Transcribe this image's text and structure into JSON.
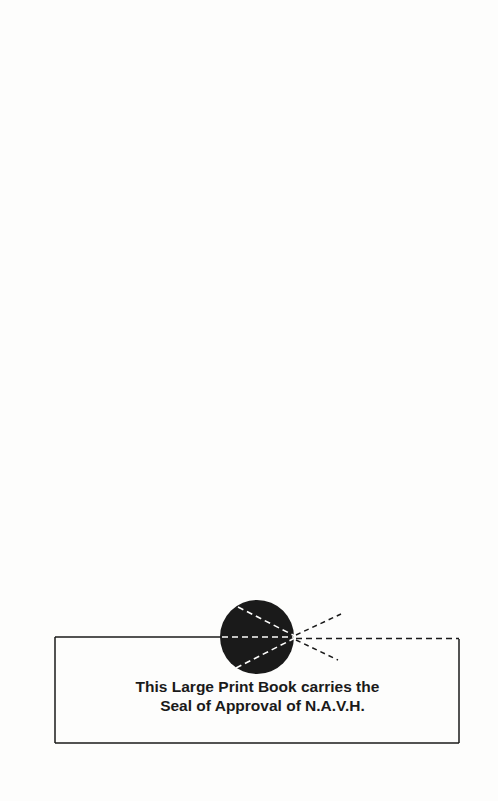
{
  "page": {
    "background": "#fdfdfc",
    "ink_color": "#1a1a1a"
  },
  "seal_notice": {
    "line1": "This Large Print Book carries the",
    "line2": "Seal of Approval of N.A.V.H.",
    "seal_icon": "eye-seal-icon"
  }
}
